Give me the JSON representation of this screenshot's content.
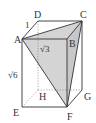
{
  "diagram": {
    "type": "rectangular-prism",
    "vertices": {
      "A": "A",
      "B": "B",
      "C": "C",
      "D": "D",
      "E": "E",
      "F": "F",
      "G": "G",
      "H": "H"
    },
    "edge_labels": {
      "AD": "1",
      "AB": "√3",
      "AE": "√6"
    },
    "shaded_triangle": "ACF",
    "colors": {
      "line": "#333333",
      "hidden_line": "#888888",
      "shade": "#d4d4d4"
    }
  }
}
